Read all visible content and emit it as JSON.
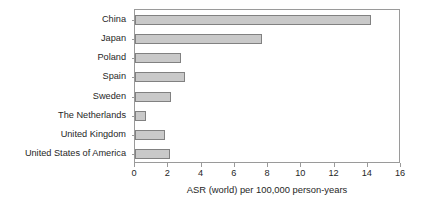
{
  "chart_data": {
    "type": "bar",
    "orientation": "horizontal",
    "title": "",
    "subtitle": "",
    "xlabel": "ASR (world) per 100,000 person-years",
    "ylabel": "",
    "categories": [
      "China",
      "Japan",
      "Poland",
      "Spain",
      "Sweden",
      "The Netherlands",
      "United Kingdom",
      "United States of America"
    ],
    "values": [
      14.2,
      7.65,
      2.75,
      3.0,
      2.15,
      0.65,
      1.8,
      2.1
    ],
    "series": [
      {
        "name": "ASR (world) per 100,000 person-years",
        "values": [
          14.2,
          7.65,
          2.75,
          3.0,
          2.15,
          0.65,
          1.8,
          2.1
        ]
      }
    ],
    "xlim": [
      0,
      16
    ],
    "xticks": [
      0,
      2,
      4,
      6,
      8,
      10,
      12,
      14,
      16
    ],
    "xtick_labels": [
      "0",
      "2",
      "4",
      "6",
      "8",
      "10",
      "12",
      "14",
      "16"
    ],
    "grid": false,
    "legend": false,
    "legend_position": "none",
    "bar_fill_color": "#c9c9c9",
    "bar_edge_color": "#818181",
    "axis_color": "#9a9a9a",
    "background_color": "#ffffff",
    "text_color": "#262626"
  }
}
